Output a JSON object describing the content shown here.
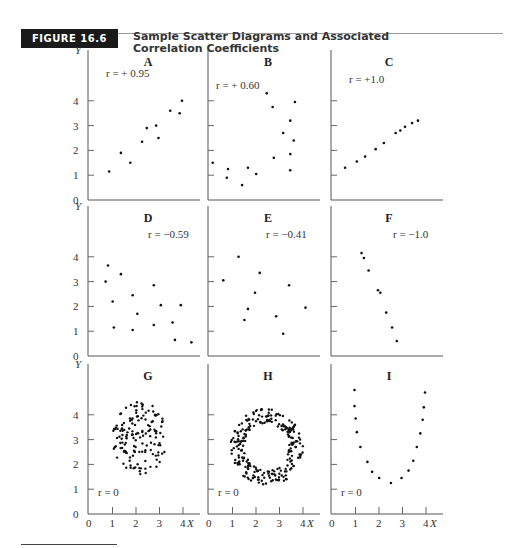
{
  "figure": {
    "badge": "FIGURE 16.6",
    "title_line1": "Sample Scatter Diagrams and Associated",
    "title_line2": "Correlation Coefficients"
  },
  "chart_data": {
    "type": "scatter",
    "title": "Sample Scatter Diagrams and Associated Correlation Coefficients",
    "xlabel": "X",
    "ylabel": "Y",
    "xlim": [
      0,
      4.5
    ],
    "ylim": [
      0,
      4.8
    ],
    "x_ticks": [
      0,
      1,
      2,
      3,
      4
    ],
    "y_ticks": [
      0,
      1,
      2,
      3,
      4
    ],
    "grid": false,
    "layout": "3x3 grid of panels",
    "panels": [
      {
        "id": "A",
        "r_label": "r = + 0.95",
        "r": 0.95,
        "points": [
          [
            0.9,
            1.15
          ],
          [
            1.4,
            1.9
          ],
          [
            1.8,
            1.5
          ],
          [
            2.3,
            2.35
          ],
          [
            2.5,
            2.9
          ],
          [
            2.9,
            3.0
          ],
          [
            3.0,
            2.5
          ],
          [
            3.5,
            3.6
          ],
          [
            3.9,
            3.5
          ],
          [
            4.0,
            4.0
          ]
        ]
      },
      {
        "id": "B",
        "r_label": "r = + 0.60",
        "r": 0.6,
        "points": [
          [
            0.2,
            1.5
          ],
          [
            0.85,
            1.25
          ],
          [
            0.8,
            0.9
          ],
          [
            1.7,
            1.3
          ],
          [
            1.45,
            0.6
          ],
          [
            2.05,
            1.05
          ],
          [
            2.8,
            1.7
          ],
          [
            2.5,
            4.3
          ],
          [
            2.75,
            3.75
          ],
          [
            3.7,
            3.95
          ],
          [
            3.2,
            2.7
          ],
          [
            3.5,
            3.2
          ],
          [
            3.65,
            2.4
          ],
          [
            3.5,
            1.85
          ],
          [
            3.5,
            1.2
          ]
        ]
      },
      {
        "id": "C",
        "r_label": "r = +1.0",
        "r": 1.0,
        "points": [
          [
            0.6,
            1.3
          ],
          [
            1.1,
            1.55
          ],
          [
            1.45,
            1.75
          ],
          [
            1.9,
            2.05
          ],
          [
            2.25,
            2.3
          ],
          [
            2.75,
            2.7
          ],
          [
            2.95,
            2.8
          ],
          [
            3.15,
            2.95
          ],
          [
            3.45,
            3.1
          ],
          [
            3.7,
            3.2
          ]
        ]
      },
      {
        "id": "D",
        "r_label": "r = −0.59",
        "r": -0.59,
        "points": [
          [
            0.75,
            3.0
          ],
          [
            0.85,
            3.65
          ],
          [
            1.05,
            2.2
          ],
          [
            1.1,
            1.15
          ],
          [
            1.4,
            3.3
          ],
          [
            1.9,
            2.45
          ],
          [
            1.9,
            1.05
          ],
          [
            2.1,
            1.7
          ],
          [
            2.8,
            2.85
          ],
          [
            2.8,
            1.25
          ],
          [
            3.1,
            2.05
          ],
          [
            3.6,
            1.35
          ],
          [
            3.7,
            0.65
          ],
          [
            3.95,
            2.05
          ],
          [
            4.4,
            0.55
          ]
        ]
      },
      {
        "id": "E",
        "r_label": "r = −0.41",
        "r": -0.41,
        "points": [
          [
            0.65,
            3.05
          ],
          [
            1.3,
            4.0
          ],
          [
            1.55,
            1.45
          ],
          [
            1.7,
            1.9
          ],
          [
            2.0,
            2.55
          ],
          [
            2.2,
            3.35
          ],
          [
            2.9,
            1.6
          ],
          [
            3.2,
            0.9
          ],
          [
            3.45,
            2.85
          ],
          [
            4.15,
            1.95
          ]
        ]
      },
      {
        "id": "F",
        "r_label": "r = −1.0",
        "r": -1.0,
        "points": [
          [
            1.3,
            4.15
          ],
          [
            1.4,
            3.95
          ],
          [
            1.6,
            3.45
          ],
          [
            2.0,
            2.65
          ],
          [
            2.1,
            2.55
          ],
          [
            2.35,
            1.75
          ],
          [
            2.6,
            1.15
          ],
          [
            2.8,
            0.6
          ]
        ]
      },
      {
        "id": "G",
        "r_label": "r = 0",
        "r": 0.0,
        "description": "circular cloud of ~150 points centered near (2.2, 3.1), x range ~1.0-3.3, y range ~1.5-4.6"
      },
      {
        "id": "H",
        "r_label": "r = 0",
        "r": 0.0,
        "description": "ring (annulus) of ~250 points centered near (2.5, 2.7), outer radius ~1.5, inner radius ~0.9"
      },
      {
        "id": "I",
        "r_label": "r = 0",
        "r": 0.0,
        "points": [
          [
            1.0,
            5.0
          ],
          [
            1.0,
            4.35
          ],
          [
            1.05,
            3.85
          ],
          [
            1.1,
            3.3
          ],
          [
            1.25,
            2.7
          ],
          [
            1.55,
            2.1
          ],
          [
            1.75,
            1.7
          ],
          [
            2.05,
            1.45
          ],
          [
            2.55,
            1.25
          ],
          [
            3.0,
            1.45
          ],
          [
            3.3,
            1.75
          ],
          [
            3.5,
            2.15
          ],
          [
            3.65,
            2.7
          ],
          [
            3.8,
            3.25
          ],
          [
            3.9,
            3.8
          ],
          [
            3.95,
            4.3
          ],
          [
            4.0,
            4.9
          ]
        ]
      }
    ]
  }
}
